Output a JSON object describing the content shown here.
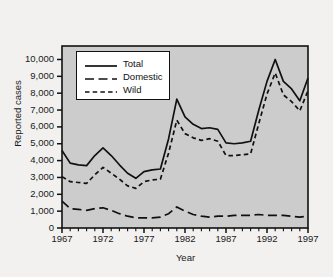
{
  "chart_data": {
    "type": "line",
    "title": "",
    "xlabel": "Year",
    "ylabel": "Reported cases",
    "xlim": [
      1967,
      1997
    ],
    "ylim": [
      0,
      10800
    ],
    "grid": false,
    "legend_position": "upper-left-inside",
    "ytick_labels": [
      "0",
      "1,000",
      "2,000",
      "3,000",
      "4,000",
      "5,000",
      "6,000",
      "7,000",
      "8,000",
      "9,000",
      "10,000"
    ],
    "ytick_values": [
      0,
      1000,
      2000,
      3000,
      4000,
      5000,
      6000,
      7000,
      8000,
      9000,
      10000
    ],
    "xtick_labels": [
      "1967",
      "1972",
      "1977",
      "1982",
      "1987",
      "1992",
      "1997"
    ],
    "xtick_values": [
      1967,
      1972,
      1977,
      1982,
      1987,
      1992,
      1997
    ],
    "x": [
      1967,
      1968,
      1969,
      1970,
      1971,
      1972,
      1973,
      1974,
      1975,
      1976,
      1977,
      1978,
      1979,
      1980,
      1981,
      1982,
      1983,
      1984,
      1985,
      1986,
      1987,
      1988,
      1989,
      1990,
      1991,
      1992,
      1993,
      1994,
      1995,
      1996,
      1997
    ],
    "series": [
      {
        "name": "Total",
        "dash": "solid",
        "values": [
          4600,
          3850,
          3750,
          3700,
          4300,
          4750,
          4300,
          3750,
          3250,
          2950,
          3350,
          3450,
          3500,
          5300,
          7650,
          6600,
          6150,
          5900,
          5950,
          5850,
          5050,
          5000,
          5050,
          5150,
          7000,
          8700,
          10000,
          8700,
          8250,
          7550,
          8900
        ]
      },
      {
        "name": "Domestic",
        "dash": "long-dash",
        "values": [
          1600,
          1150,
          1100,
          1050,
          1150,
          1200,
          1050,
          850,
          700,
          600,
          600,
          600,
          650,
          850,
          1250,
          1000,
          800,
          700,
          650,
          700,
          700,
          750,
          750,
          750,
          800,
          750,
          750,
          750,
          700,
          650,
          700
        ]
      },
      {
        "name": "Wild",
        "dash": "short-dash",
        "values": [
          3050,
          2750,
          2700,
          2650,
          3150,
          3600,
          3250,
          2900,
          2500,
          2350,
          2750,
          2850,
          2900,
          4450,
          6400,
          5600,
          5350,
          5200,
          5300,
          5150,
          4300,
          4300,
          4350,
          4400,
          6200,
          7950,
          9200,
          7900,
          7500,
          6950,
          8150
        ]
      }
    ]
  },
  "legend": {
    "items": [
      {
        "label": "Total"
      },
      {
        "label": "Domestic"
      },
      {
        "label": "Wild"
      }
    ]
  },
  "colors": {
    "page_background": "#f2f1ef",
    "plot_background": "#cccccc",
    "axis": "#111111",
    "line": "#111111",
    "legend_background": "#ffffff"
  }
}
